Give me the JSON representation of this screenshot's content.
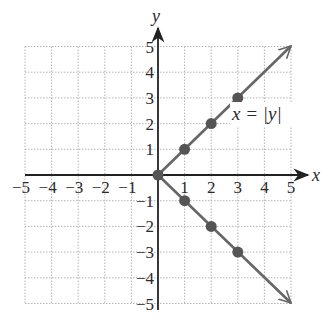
{
  "chart_data": {
    "type": "line",
    "title": "",
    "equation_label": "x = |y|",
    "xlabel": "x",
    "ylabel": "y",
    "xlim": [
      -5,
      5
    ],
    "ylim": [
      -5,
      5
    ],
    "x_ticks": [
      -5,
      -4,
      -3,
      -2,
      -1,
      1,
      2,
      3,
      4,
      5
    ],
    "y_ticks": [
      -5,
      -4,
      -3,
      -2,
      -1,
      1,
      2,
      3,
      4,
      5
    ],
    "x_tick_labels": [
      "−5",
      "−4",
      "−3",
      "−2",
      "−1",
      "1",
      "2",
      "3",
      "4",
      "5"
    ],
    "y_tick_labels": [
      "−5",
      "−4",
      "−3",
      "−2",
      "−1",
      "1",
      "2",
      "3",
      "4",
      "5"
    ],
    "grid": true,
    "grid_style": "dotted",
    "series": [
      {
        "name": "x = |y| (upper branch, y ≥ 0)",
        "x": [
          0,
          5
        ],
        "y": [
          0,
          5
        ],
        "arrow_end": true
      },
      {
        "name": "x = |y| (lower branch, y ≤ 0)",
        "x": [
          0,
          5
        ],
        "y": [
          0,
          -5
        ],
        "arrow_end": true
      }
    ],
    "points": [
      {
        "x": 0,
        "y": 0
      },
      {
        "x": 1,
        "y": 1
      },
      {
        "x": 2,
        "y": 2
      },
      {
        "x": 3,
        "y": 3
      },
      {
        "x": 1,
        "y": -1
      },
      {
        "x": 2,
        "y": -2
      },
      {
        "x": 3,
        "y": -3
      }
    ],
    "colors": {
      "line": "#666666",
      "point": "#555555",
      "axis": "#222222",
      "grid": "#b5b5b5"
    }
  },
  "labels": {
    "x_axis": "x",
    "y_axis": "y",
    "equation": "x = |y|",
    "x_ticks": [
      "−5",
      "−4",
      "−3",
      "−2",
      "−1",
      "1",
      "2",
      "3",
      "4",
      "5"
    ],
    "y_ticks_pos": [
      "1",
      "2",
      "3",
      "4",
      "5"
    ],
    "y_ticks_neg": [
      "−1",
      "−2",
      "−3",
      "−4",
      "−5"
    ]
  }
}
